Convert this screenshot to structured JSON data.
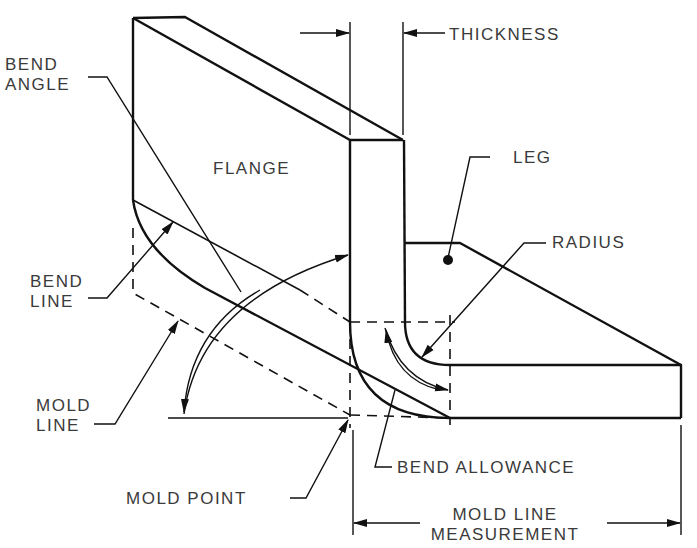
{
  "diagram": {
    "type": "sheet-metal-bend-terminology",
    "labels": {
      "bend_angle": [
        "BEND",
        "ANGLE"
      ],
      "flange": "FLANGE",
      "thickness": "THICKNESS",
      "leg": "LEG",
      "bend_line": [
        "BEND",
        "LINE"
      ],
      "radius": "RADIUS",
      "mold_line": [
        "MOLD",
        "LINE"
      ],
      "bend_allowance": "BEND ALLOWANCE",
      "mold_point": "MOLD POINT",
      "mold_line_measurement": [
        "MOLD LINE",
        "MEASUREMENT"
      ]
    },
    "colors": {
      "line": "#111111",
      "text": "#3a3a3a",
      "background": "#ffffff"
    }
  }
}
